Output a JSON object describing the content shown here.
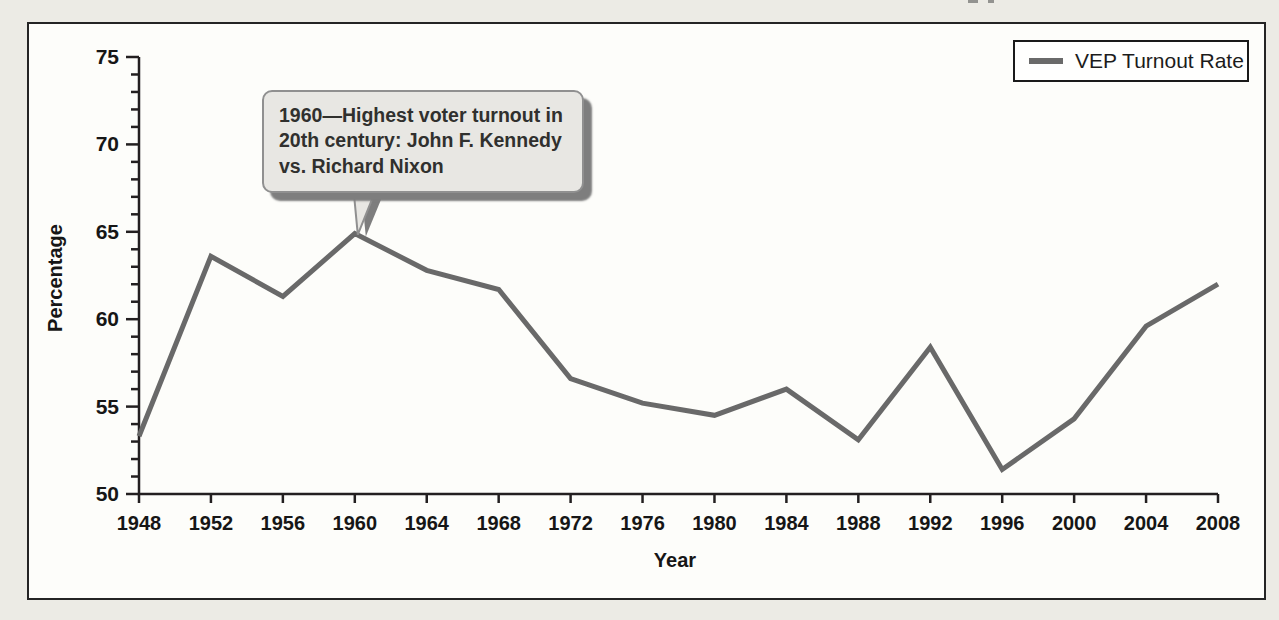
{
  "page": {
    "background": "#ecebe5"
  },
  "figure": {
    "background": "#fdfdfa",
    "border_color": "#242424"
  },
  "chart_data": {
    "type": "line",
    "title": "",
    "xlabel": "Year",
    "ylabel": "Percentage",
    "x": [
      1948,
      1952,
      1956,
      1960,
      1964,
      1968,
      1972,
      1976,
      1980,
      1984,
      1988,
      1992,
      1996,
      2000,
      2004,
      2008
    ],
    "series": [
      {
        "name": "VEP Turnout Rate",
        "color": "#696969",
        "values": [
          53.3,
          63.6,
          61.3,
          64.9,
          62.8,
          61.7,
          56.6,
          55.2,
          54.5,
          56.0,
          53.1,
          58.4,
          51.4,
          54.3,
          59.6,
          62.0
        ]
      }
    ],
    "ylim": [
      50,
      75
    ],
    "y_major_step": 5,
    "y_minor_step": 1,
    "x_tick_step": 4,
    "grid": false,
    "legend_position": "top-right",
    "axis_color": "#231f20"
  },
  "annotation": {
    "lines": [
      "1960—Highest voter turnout in",
      "20th century: John F. Kennedy",
      "vs. Richard Nixon"
    ],
    "target_year": 1960,
    "target_value": 64.9,
    "fill": "#e8e7e3",
    "border_color": "#909090",
    "shadow_color": "#7e7e7e",
    "text_color": "#30302e"
  }
}
